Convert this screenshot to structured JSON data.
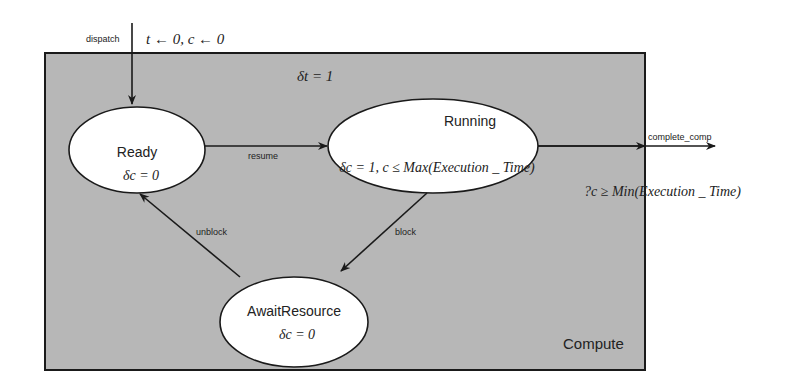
{
  "diagram": {
    "container": {
      "label": "Compute",
      "fill": "#b7b7b7",
      "stroke": "#1a1a1a"
    },
    "container_annotation": "δt = 1",
    "states": [
      {
        "id": "ready",
        "name": "Ready",
        "rate": "δc = 0"
      },
      {
        "id": "running",
        "name": "Running",
        "rate": "δc = 1, c ≤ Max(Execution _ Time)"
      },
      {
        "id": "await",
        "name": "AwaitResource",
        "rate": "δc = 0"
      }
    ],
    "transitions": [
      {
        "id": "dispatch",
        "label": "dispatch",
        "from": "",
        "to": "ready",
        "action": "t ← 0, c ← 0"
      },
      {
        "id": "resume",
        "label": "resume",
        "from": "ready",
        "to": "running"
      },
      {
        "id": "block",
        "label": "block",
        "from": "running",
        "to": "await"
      },
      {
        "id": "unblock",
        "label": "unblock",
        "from": "await",
        "to": "ready"
      },
      {
        "id": "complete",
        "label": "complete_comp",
        "from": "running",
        "to": "",
        "guard": "?c ≥ Min(Execution _ Time)"
      }
    ]
  }
}
